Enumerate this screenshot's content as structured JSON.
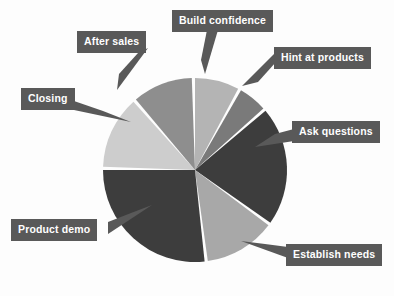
{
  "chart_data": {
    "type": "pie",
    "title": "",
    "subtitle": "",
    "xlabel": "",
    "ylabel": "",
    "legend_position": "callout-labels-on-slices",
    "grid": false,
    "categories": [
      "Build confidence",
      "Hint at products",
      "Ask questions",
      "Establish needs",
      "Product demo",
      "Closing",
      "After sales"
    ],
    "values": [
      8,
      5,
      21,
      13,
      27,
      14,
      12
    ],
    "units": "percent",
    "slices": [
      {
        "label": "Build confidence",
        "value": 8,
        "start_angle_deg": 0,
        "end_angle_deg": 28,
        "color": "#b4b4b4"
      },
      {
        "label": "Hint at products",
        "value": 5,
        "start_angle_deg": 30,
        "end_angle_deg": 48,
        "color": "#7a7a7a"
      },
      {
        "label": "Ask questions",
        "value": 21,
        "start_angle_deg": 50,
        "end_angle_deg": 125,
        "color": "#3d3d3d"
      },
      {
        "label": "Establish needs",
        "value": 13,
        "start_angle_deg": 127,
        "end_angle_deg": 172,
        "color": "#a8a8a8"
      },
      {
        "label": "Product demo",
        "value": 27,
        "start_angle_deg": 174,
        "end_angle_deg": 270,
        "color": "#3d3d3d"
      },
      {
        "label": "Closing",
        "value": 14,
        "start_angle_deg": 272,
        "end_angle_deg": 318,
        "color": "#cdcdcd"
      },
      {
        "label": "After sales",
        "value": 12,
        "start_angle_deg": 320,
        "end_angle_deg": 358,
        "color": "#8e8e8e"
      }
    ]
  },
  "labels": {
    "build_confidence": "Build confidence",
    "hint_at_products": "Hint at products",
    "ask_questions": "Ask questions",
    "establish_needs": "Establish needs",
    "product_demo": "Product demo",
    "closing": "Closing",
    "after_sales": "After sales"
  },
  "colors": {
    "label_box_background": "#595959",
    "label_text": "#ffffff",
    "page_background": "#fdfdfd",
    "slice_separator": "#ffffff",
    "dark_slice": "#3d3d3d",
    "mid_slice": "#8e8e8e",
    "light_slice": "#cdcdcd"
  }
}
